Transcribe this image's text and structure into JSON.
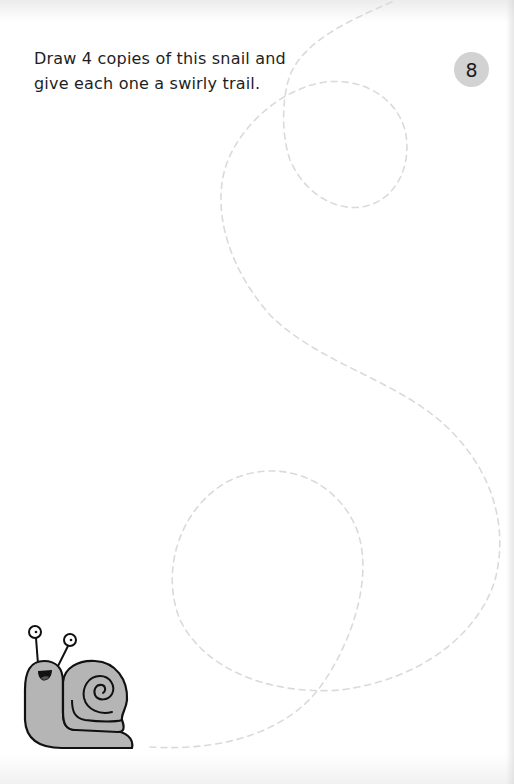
{
  "page": {
    "number": "8",
    "instruction_lines": [
      "Draw 4 copies of this snail and",
      "give each one a swirly trail."
    ]
  },
  "illustration": {
    "subject": "snail",
    "trail_style": "dashed-swirl",
    "colors": {
      "snail_fill": "#b5b5b5",
      "snail_outline": "#111111",
      "trail": "#d9d9d9",
      "badge": "#d2d2d2",
      "text": "#1e1e1e"
    }
  }
}
